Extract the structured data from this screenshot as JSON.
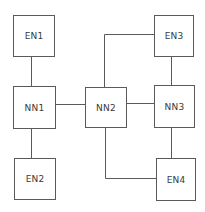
{
  "diagram": {
    "nodes": [
      {
        "id": "EN1",
        "label": "EN1",
        "type": "end-node"
      },
      {
        "id": "NN1",
        "label": "NN1",
        "type": "network-node"
      },
      {
        "id": "EN2",
        "label": "EN2",
        "type": "end-node"
      },
      {
        "id": "NN2",
        "label": "NN2",
        "type": "network-node"
      },
      {
        "id": "EN3",
        "label": "EN3",
        "type": "end-node"
      },
      {
        "id": "NN3",
        "label": "NN3",
        "type": "network-node"
      },
      {
        "id": "EN4",
        "label": "EN4",
        "type": "end-node"
      }
    ],
    "edges": [
      {
        "from": "EN1",
        "to": "NN1"
      },
      {
        "from": "NN1",
        "to": "EN2"
      },
      {
        "from": "NN1",
        "to": "NN2"
      },
      {
        "from": "NN2",
        "to": "EN3"
      },
      {
        "from": "NN2",
        "to": "NN3"
      },
      {
        "from": "EN3",
        "to": "NN3"
      },
      {
        "from": "NN3",
        "to": "EN4"
      },
      {
        "from": "NN2",
        "to": "EN4"
      }
    ],
    "colors": {
      "line": "#5a5a5a",
      "text": "#3a3a3a",
      "background": "#ffffff"
    }
  }
}
